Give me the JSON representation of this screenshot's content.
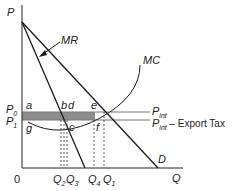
{
  "diagram": {
    "axes": {
      "y_label": "P",
      "x_label": "Q",
      "origin_label": "0"
    },
    "curves": {
      "mr": "MR",
      "mc": "MC",
      "demand": "D"
    },
    "price_lines": {
      "p_int": "P",
      "p_int_sub": "int",
      "p_int_tax": "P",
      "p_int_tax_sub": "int",
      "p_int_tax_suffix": " – Export Tax"
    },
    "price_labels": {
      "p0": "P",
      "p0_sub": "0",
      "p1": "P",
      "p1_sub": "1"
    },
    "points": {
      "a": "a",
      "b": "b",
      "c": "c",
      "d": "d",
      "e": "e",
      "f": "f",
      "g": "g"
    },
    "quantities": {
      "q2": "Q",
      "q2_sub": "2",
      "q3": "Q",
      "q3_sub": "3",
      "q4": "Q",
      "q4_sub": "4",
      "q1": "Q",
      "q1_sub": "1"
    },
    "colors": {
      "lines": "#1a1a1a",
      "price_lines": "#777777",
      "shaded_area": "#8c8c8c"
    }
  }
}
